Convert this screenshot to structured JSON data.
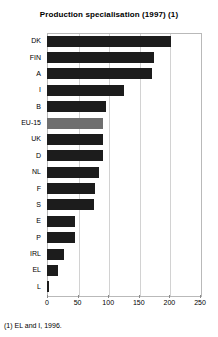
{
  "chart_data": {
    "type": "bar",
    "orientation": "horizontal",
    "title": "Production specialisation (1997) (1)",
    "xlabel": "",
    "ylabel": "",
    "xlim": [
      0,
      250
    ],
    "xticks": [
      0,
      50,
      100,
      150,
      200,
      250
    ],
    "xtick_labels": [
      "0",
      "50",
      "100",
      "150",
      "200",
      "250"
    ],
    "grid": true,
    "legend": "none",
    "categories": [
      "DK",
      "FIN",
      "A",
      "I",
      "B",
      "EU-15",
      "UK",
      "D",
      "NL",
      "F",
      "S",
      "E",
      "P",
      "IRL",
      "EL",
      "L"
    ],
    "values": [
      203,
      175,
      172,
      126,
      96,
      92,
      92,
      92,
      85,
      79,
      76,
      46,
      46,
      28,
      18,
      3
    ],
    "bar_colors": {
      "default": "#1c1c1c",
      "highlight": "#6f6f6f"
    },
    "highlight_category": "EU-15",
    "bars": [
      {
        "label": "DK",
        "value": 203,
        "highlight": false
      },
      {
        "label": "FIN",
        "value": 175,
        "highlight": false
      },
      {
        "label": "A",
        "value": 172,
        "highlight": false
      },
      {
        "label": "I",
        "value": 126,
        "highlight": false
      },
      {
        "label": "B",
        "value": 96,
        "highlight": false
      },
      {
        "label": "EU-15",
        "value": 92,
        "highlight": true
      },
      {
        "label": "UK",
        "value": 92,
        "highlight": false
      },
      {
        "label": "D",
        "value": 92,
        "highlight": false
      },
      {
        "label": "NL",
        "value": 85,
        "highlight": false
      },
      {
        "label": "F",
        "value": 79,
        "highlight": false
      },
      {
        "label": "S",
        "value": 76,
        "highlight": false
      },
      {
        "label": "E",
        "value": 46,
        "highlight": false
      },
      {
        "label": "P",
        "value": 46,
        "highlight": false
      },
      {
        "label": "IRL",
        "value": 28,
        "highlight": false
      },
      {
        "label": "EL",
        "value": 18,
        "highlight": false
      },
      {
        "label": "L",
        "value": 3,
        "highlight": false
      }
    ]
  },
  "footnote": "(1) EL and I, 1996."
}
